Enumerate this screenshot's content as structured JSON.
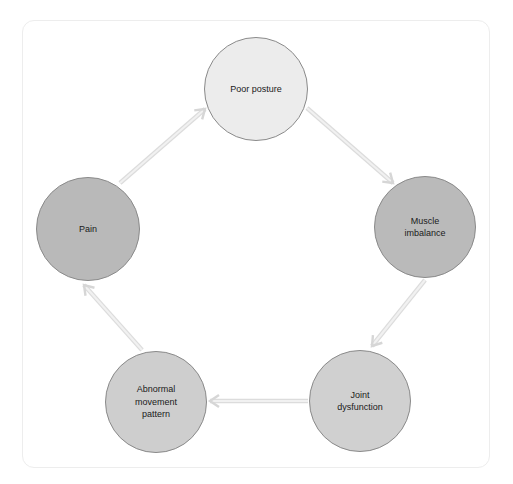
{
  "diagram": {
    "type": "cycle",
    "colors": {
      "light_node": "#ececec",
      "dark_node": "#b9b9b9",
      "mid_node": "#cfcfcf",
      "node_border": "#8a8a8a",
      "arrow": "#e2e2e2",
      "card_border": "#ededed"
    },
    "nodes": [
      {
        "id": "poor-posture",
        "label": "Poor posture",
        "cx": 256,
        "cy": 89,
        "r": 52,
        "fill": "#ececec"
      },
      {
        "id": "muscle-imbalance",
        "label": "Muscle\nimbalance",
        "cx": 425,
        "cy": 227,
        "r": 51,
        "fill": "#bababa"
      },
      {
        "id": "joint-dysfunction",
        "label": "Joint\ndysfunction",
        "cx": 360,
        "cy": 401,
        "r": 51,
        "fill": "#d0d0d0"
      },
      {
        "id": "abnormal-movement-pattern",
        "label": "Abnormal\nmovement\npattern",
        "cx": 156,
        "cy": 402,
        "r": 51,
        "fill": "#cecece"
      },
      {
        "id": "pain",
        "label": "Pain",
        "cx": 88,
        "cy": 229,
        "r": 52,
        "fill": "#b9b9b9"
      }
    ],
    "edges": [
      {
        "from": "poor-posture",
        "to": "muscle-imbalance",
        "x1": 307,
        "y1": 108,
        "x2": 393,
        "y2": 183
      },
      {
        "from": "muscle-imbalance",
        "to": "joint-dysfunction",
        "x1": 425,
        "y1": 280,
        "x2": 372,
        "y2": 346
      },
      {
        "from": "joint-dysfunction",
        "to": "abnormal-movement-pattern",
        "x1": 308,
        "y1": 401,
        "x2": 210,
        "y2": 401
      },
      {
        "from": "abnormal-movement-pattern",
        "to": "pain",
        "x1": 142,
        "y1": 350,
        "x2": 84,
        "y2": 285
      },
      {
        "from": "pain",
        "to": "poor-posture",
        "x1": 120,
        "y1": 183,
        "x2": 205,
        "y2": 109
      }
    ]
  }
}
